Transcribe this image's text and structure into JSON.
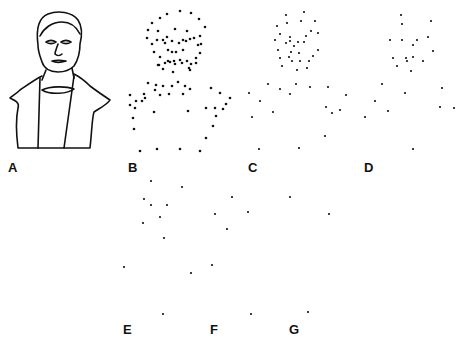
{
  "labels": [
    {
      "text": "A",
      "x": 8,
      "y": 160
    },
    {
      "text": "B",
      "x": 128,
      "y": 160
    },
    {
      "text": "C",
      "x": 248,
      "y": 160
    },
    {
      "text": "D",
      "x": 364,
      "y": 160
    },
    {
      "text": "E",
      "x": 123,
      "y": 322
    },
    {
      "text": "F",
      "x": 210,
      "y": 322
    },
    {
      "text": "G",
      "x": 289,
      "y": 322
    }
  ],
  "panels": {
    "B": [
      [
        167,
        14
      ],
      [
        180,
        11
      ],
      [
        160,
        18
      ],
      [
        191,
        13
      ],
      [
        152,
        23
      ],
      [
        199,
        19
      ],
      [
        148,
        30
      ],
      [
        205,
        27
      ],
      [
        158,
        31
      ],
      [
        175,
        29
      ],
      [
        187,
        31
      ],
      [
        157,
        40
      ],
      [
        167,
        37
      ],
      [
        147,
        38
      ],
      [
        194,
        38
      ],
      [
        200,
        36
      ],
      [
        201,
        44
      ],
      [
        152,
        44
      ],
      [
        198,
        45
      ],
      [
        200,
        53
      ],
      [
        154,
        52
      ],
      [
        160,
        57
      ],
      [
        196,
        58
      ],
      [
        159,
        65
      ],
      [
        196,
        63
      ],
      [
        172,
        52
      ],
      [
        176,
        52
      ],
      [
        163,
        40
      ],
      [
        172,
        41
      ],
      [
        179,
        43
      ],
      [
        186,
        41
      ],
      [
        190,
        39
      ],
      [
        165,
        43
      ],
      [
        183,
        40
      ],
      [
        168,
        61
      ],
      [
        174,
        61
      ],
      [
        180,
        60
      ],
      [
        165,
        63
      ],
      [
        170,
        62
      ],
      [
        175,
        64
      ],
      [
        182,
        63
      ],
      [
        187,
        61
      ],
      [
        158,
        65
      ],
      [
        191,
        64
      ],
      [
        163,
        69
      ],
      [
        173,
        72
      ],
      [
        189,
        68
      ],
      [
        168,
        50
      ],
      [
        183,
        50
      ],
      [
        190,
        70
      ],
      [
        148,
        83
      ],
      [
        178,
        82
      ],
      [
        156,
        85
      ],
      [
        163,
        86
      ],
      [
        172,
        86
      ],
      [
        185,
        86
      ],
      [
        190,
        89
      ],
      [
        130,
        95
      ],
      [
        145,
        98
      ],
      [
        155,
        90
      ],
      [
        160,
        95
      ],
      [
        169,
        94
      ],
      [
        183,
        94
      ],
      [
        144,
        94
      ],
      [
        136,
        101
      ],
      [
        130,
        105
      ],
      [
        142,
        101
      ],
      [
        211,
        88
      ],
      [
        220,
        93
      ],
      [
        230,
        98
      ],
      [
        206,
        108
      ],
      [
        215,
        108
      ],
      [
        223,
        109
      ],
      [
        226,
        104
      ],
      [
        135,
        108
      ],
      [
        133,
        118
      ],
      [
        154,
        112
      ],
      [
        188,
        111
      ],
      [
        216,
        116
      ],
      [
        213,
        126
      ],
      [
        134,
        129
      ],
      [
        206,
        138
      ],
      [
        140,
        151
      ],
      [
        157,
        149
      ],
      [
        180,
        149
      ],
      [
        200,
        151
      ]
    ],
    "C": [
      [
        286,
        15
      ],
      [
        304,
        12
      ],
      [
        301,
        21
      ],
      [
        315,
        21
      ],
      [
        277,
        26
      ],
      [
        287,
        23
      ],
      [
        280,
        34
      ],
      [
        311,
        31
      ],
      [
        318,
        33
      ],
      [
        275,
        40
      ],
      [
        290,
        37
      ],
      [
        306,
        36
      ],
      [
        290,
        41
      ],
      [
        298,
        42
      ],
      [
        304,
        42
      ],
      [
        286,
        43
      ],
      [
        294,
        46
      ],
      [
        278,
        50
      ],
      [
        291,
        52
      ],
      [
        299,
        53
      ],
      [
        318,
        50
      ],
      [
        289,
        57
      ],
      [
        313,
        56
      ],
      [
        280,
        58
      ],
      [
        292,
        61
      ],
      [
        300,
        61
      ],
      [
        309,
        61
      ],
      [
        282,
        66
      ],
      [
        297,
        70
      ],
      [
        307,
        68
      ],
      [
        268,
        84
      ],
      [
        280,
        89
      ],
      [
        296,
        84
      ],
      [
        310,
        87
      ],
      [
        328,
        87
      ],
      [
        249,
        93
      ],
      [
        260,
        101
      ],
      [
        290,
        94
      ],
      [
        346,
        95
      ],
      [
        273,
        112
      ],
      [
        326,
        107
      ],
      [
        340,
        110
      ],
      [
        332,
        113
      ],
      [
        252,
        117
      ],
      [
        325,
        136
      ],
      [
        259,
        149
      ],
      [
        299,
        148
      ]
    ],
    "D": [
      [
        401,
        15
      ],
      [
        402,
        24
      ],
      [
        431,
        21
      ],
      [
        390,
        40
      ],
      [
        402,
        40
      ],
      [
        417,
        40
      ],
      [
        428,
        37
      ],
      [
        413,
        45
      ],
      [
        433,
        51
      ],
      [
        393,
        58
      ],
      [
        406,
        58
      ],
      [
        413,
        57
      ],
      [
        423,
        61
      ],
      [
        397,
        66
      ],
      [
        407,
        61
      ],
      [
        411,
        71
      ],
      [
        382,
        84
      ],
      [
        405,
        93
      ],
      [
        442,
        88
      ],
      [
        375,
        101
      ],
      [
        388,
        111
      ],
      [
        440,
        107
      ],
      [
        454,
        108
      ],
      [
        365,
        117
      ],
      [
        413,
        149
      ]
    ],
    "E": [
      [
        151,
        181
      ],
      [
        144,
        199
      ],
      [
        151,
        205
      ],
      [
        167,
        205
      ],
      [
        160,
        217
      ],
      [
        143,
        223
      ],
      [
        164,
        238
      ],
      [
        124,
        267
      ]
    ],
    "F": [
      [
        182,
        187
      ],
      [
        232,
        197
      ],
      [
        215,
        214
      ],
      [
        248,
        212
      ],
      [
        227,
        229
      ],
      [
        212,
        265
      ],
      [
        191,
        273
      ],
      [
        163,
        314
      ]
    ],
    "G": [
      [
        290,
        197
      ],
      [
        329,
        214
      ],
      [
        251,
        314
      ],
      [
        308,
        312
      ]
    ]
  }
}
